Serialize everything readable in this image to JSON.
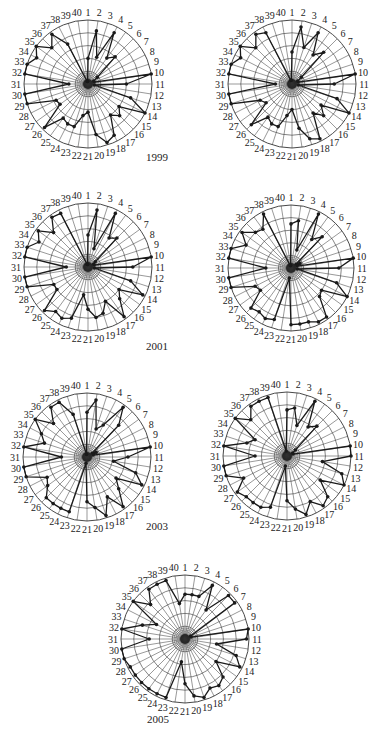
{
  "chart_data": [
    {
      "type": "radar",
      "year_label": "1999",
      "panel": "1999-left",
      "categories": [
        "1",
        "2",
        "3",
        "4",
        "5",
        "6",
        "7",
        "8",
        "9",
        "10",
        "11",
        "12",
        "13",
        "14",
        "15",
        "16",
        "17",
        "18",
        "19",
        "20",
        "21",
        "22",
        "23",
        "24",
        "25",
        "26",
        "27",
        "28",
        "29",
        "30",
        "31",
        "32",
        "33",
        "34",
        "35",
        "36",
        "37",
        "38",
        "39",
        "40"
      ],
      "values": [
        2,
        4.2,
        2.2,
        4.5,
        2.5,
        3,
        0.9,
        0.5,
        0.5,
        5,
        3,
        0.5,
        3.5,
        5,
        3,
        3.5,
        3,
        4.5,
        4.8,
        4,
        2.2,
        2.5,
        3.5,
        3.5,
        3.3,
        4.8,
        2.7,
        2.8,
        5,
        5,
        1.5,
        5,
        5,
        4.5,
        5,
        4,
        4.8,
        3.5,
        0.2,
        0.2
      ],
      "ylim": [
        0,
        5
      ],
      "rings": 5
    },
    {
      "type": "radar",
      "panel": "1999-right",
      "categories": [
        "1",
        "2",
        "3",
        "4",
        "5",
        "6",
        "7",
        "8",
        "9",
        "10",
        "11",
        "12",
        "13",
        "14",
        "15",
        "16",
        "17",
        "18",
        "19",
        "20",
        "21",
        "22",
        "23",
        "24",
        "25",
        "26",
        "27",
        "28",
        "29",
        "30",
        "31",
        "32",
        "33",
        "34",
        "35",
        "36",
        "37",
        "38",
        "39",
        "40"
      ],
      "values": [
        2.5,
        4.5,
        3,
        4.5,
        2.8,
        3.5,
        0.9,
        0.5,
        0.5,
        5,
        3.3,
        0.5,
        3.7,
        5,
        2.8,
        3.5,
        2.8,
        4.8,
        4.5,
        3.5,
        2,
        2.5,
        3.5,
        3.5,
        3.2,
        4.5,
        2.5,
        2.8,
        5,
        5,
        1.3,
        5,
        5,
        4.5,
        5,
        4,
        4.8,
        4.5,
        0.3,
        0.3
      ],
      "ylim": [
        0,
        5
      ],
      "rings": 5
    },
    {
      "type": "radar",
      "year_label": "2001",
      "panel": "2001-left",
      "categories": [
        "1",
        "2",
        "3",
        "4",
        "5",
        "6",
        "7",
        "8",
        "9",
        "10",
        "11",
        "12",
        "13",
        "14",
        "15",
        "16",
        "17",
        "18",
        "19",
        "20",
        "21",
        "22",
        "23",
        "24",
        "25",
        "26",
        "27",
        "28",
        "29",
        "30",
        "31",
        "32",
        "33",
        "34",
        "35",
        "36",
        "37",
        "38",
        "39",
        "40"
      ],
      "values": [
        2.5,
        4.5,
        1.5,
        4.7,
        2.8,
        3.2,
        0.7,
        0.5,
        0.5,
        5,
        3.5,
        0.5,
        3.5,
        4.8,
        3,
        3.5,
        4.8,
        3,
        3.8,
        4,
        3.3,
        2.2,
        4.2,
        4.5,
        4.3,
        4.8,
        3,
        3,
        5,
        5,
        1.7,
        5,
        5,
        4.3,
        4.8,
        3.8,
        4.8,
        4.7,
        0.2,
        0.2
      ],
      "ylim": [
        0,
        5
      ],
      "rings": 5
    },
    {
      "type": "radar",
      "panel": "2001-right",
      "categories": [
        "1",
        "2",
        "3",
        "4",
        "5",
        "6",
        "7",
        "8",
        "9",
        "10",
        "11",
        "12",
        "13",
        "14",
        "15",
        "16",
        "17",
        "18",
        "19",
        "20",
        "21",
        "22",
        "23",
        "24",
        "25",
        "26",
        "27",
        "28",
        "29",
        "30",
        "31",
        "32",
        "33",
        "34",
        "35",
        "36",
        "37",
        "38",
        "39",
        "40"
      ],
      "values": [
        3.5,
        3.8,
        1.5,
        4.8,
        2.8,
        3.5,
        0.5,
        0.8,
        0.5,
        5,
        3.8,
        0.5,
        3.8,
        5,
        3,
        3.2,
        4.8,
        4.8,
        4.5,
        4.5,
        4.5,
        0.8,
        4.3,
        4.5,
        4.3,
        4.5,
        3,
        3.2,
        5,
        5,
        2,
        5,
        5,
        4,
        4.8,
        4,
        3.8,
        4.8,
        0.2,
        0.2
      ],
      "ylim": [
        0,
        5
      ],
      "rings": 5
    },
    {
      "type": "radar",
      "year_label": "2003",
      "panel": "2003-left",
      "categories": [
        "1",
        "2",
        "3",
        "4",
        "5",
        "6",
        "7",
        "8",
        "9",
        "10",
        "11",
        "12",
        "13",
        "14",
        "15",
        "16",
        "17",
        "18",
        "19",
        "20",
        "21",
        "22",
        "23",
        "24",
        "25",
        "26",
        "27",
        "28",
        "29",
        "30",
        "31",
        "32",
        "33",
        "34",
        "35",
        "36",
        "37",
        "38",
        "39",
        "40"
      ],
      "values": [
        3.5,
        4.5,
        2.3,
        2.8,
        4.8,
        3.5,
        0.5,
        0.8,
        0.5,
        5,
        3.2,
        2.1,
        4,
        4.8,
        2.8,
        3.5,
        4.8,
        3.5,
        4.8,
        4,
        3.5,
        0.5,
        4.5,
        4.5,
        4.5,
        4.5,
        3.8,
        3.5,
        5,
        5,
        2,
        5,
        3.5,
        4,
        5,
        3.7,
        4.8,
        4.8,
        3.5,
        0.2
      ],
      "ylim": [
        0,
        5
      ],
      "rings": 5
    },
    {
      "type": "radar",
      "panel": "2003-right",
      "categories": [
        "1",
        "2",
        "3",
        "4",
        "5",
        "6",
        "7",
        "8",
        "9",
        "10",
        "11",
        "12",
        "13",
        "14",
        "15",
        "16",
        "17",
        "18",
        "19",
        "20",
        "21",
        "22",
        "23",
        "24",
        "25",
        "26",
        "27",
        "28",
        "29",
        "30",
        "31",
        "32",
        "33",
        "34",
        "35",
        "36",
        "37",
        "38",
        "39",
        "40"
      ],
      "values": [
        3.6,
        3.8,
        2.5,
        4.8,
        2.8,
        3.3,
        0.8,
        0.5,
        0.5,
        5,
        5,
        2.8,
        4.5,
        5,
        3.2,
        4.5,
        4.8,
        4,
        4.8,
        4.2,
        3.5,
        0.8,
        4.2,
        4.5,
        4.5,
        4.5,
        4.8,
        3.8,
        5,
        5,
        2.5,
        5,
        3.3,
        2.8,
        5,
        4,
        4.8,
        4.8,
        4.8,
        0.4
      ],
      "ylim": [
        0,
        5
      ],
      "rings": 5
    },
    {
      "type": "radar",
      "year_label": "2005",
      "panel": "2005-center",
      "categories": [
        "1",
        "2",
        "3",
        "4",
        "5",
        "6",
        "7",
        "8",
        "9",
        "10",
        "11",
        "12",
        "13",
        "14",
        "15",
        "16",
        "17",
        "18",
        "19",
        "20",
        "21",
        "22",
        "23",
        "24",
        "25",
        "26",
        "27",
        "28",
        "29",
        "30",
        "31",
        "32",
        "33",
        "34",
        "35",
        "36",
        "37",
        "38",
        "39",
        "40"
      ],
      "values": [
        3.5,
        3.5,
        3.5,
        4.7,
        2.8,
        4.8,
        4.8,
        0.5,
        0.5,
        5,
        4.8,
        2.5,
        4.2,
        4.8,
        3,
        4.2,
        4.5,
        4.3,
        4.8,
        4.5,
        3.5,
        1.8,
        4.8,
        4.8,
        4.8,
        4.8,
        4.8,
        4.8,
        5,
        5,
        2.8,
        5,
        3.5,
        2.5,
        5,
        3.8,
        4.8,
        4.8,
        4.8,
        2.8
      ],
      "ylim": [
        0,
        5
      ],
      "rings": 5
    }
  ],
  "year_labels": [
    {
      "text": "1999",
      "x": 146,
      "y": 161
    },
    {
      "text": "2001",
      "x": 146,
      "y": 350
    },
    {
      "text": "2003",
      "x": 146,
      "y": 530
    },
    {
      "text": "2005",
      "x": 147,
      "y": 723
    }
  ],
  "panels": [
    {
      "cx": 88,
      "cy": 84,
      "r": 64
    },
    {
      "cx": 292,
      "cy": 84,
      "r": 64
    },
    {
      "cx": 88,
      "cy": 267,
      "r": 64
    },
    {
      "cx": 291,
      "cy": 268,
      "r": 63
    },
    {
      "cx": 87,
      "cy": 457,
      "r": 64
    },
    {
      "cx": 287,
      "cy": 456,
      "r": 64
    },
    {
      "cx": 185,
      "cy": 639,
      "r": 64
    }
  ],
  "style": {
    "line_color": "#1a1a1a",
    "grid_color": "#333333",
    "background": "#ffffff"
  }
}
